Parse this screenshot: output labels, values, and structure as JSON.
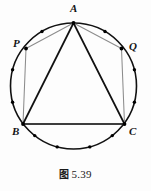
{
  "figure": {
    "caption_cjk": "图",
    "caption_number": "5.39",
    "caption_full": "图 5.39",
    "colors": {
      "stroke_dark": "#111111",
      "stroke_light": "#8c8c8c",
      "background": "#fdfdfd",
      "dot_fill": "#000000",
      "label_color": "#141414"
    },
    "circle": {
      "cx": 73.5,
      "cy": 86.0,
      "r": 63.0,
      "stroke_width": 1.6
    },
    "labels": [
      {
        "id": "A",
        "text": "A",
        "x": 70.0,
        "y": 3.0
      },
      {
        "id": "P",
        "text": "P",
        "x": 13.0,
        "y": 38.0
      },
      {
        "id": "Q",
        "text": "Q",
        "x": 129.0,
        "y": 41.0
      },
      {
        "id": "B",
        "text": "B",
        "x": 12.0,
        "y": 126.0
      },
      {
        "id": "C",
        "text": "C",
        "x": 129.0,
        "y": 126.0
      }
    ],
    "vertices": [
      {
        "id": "A",
        "x": 73.5,
        "y": 23.0,
        "angle_deg": 90
      },
      {
        "id": "P",
        "x": 26.0,
        "y": 48.5,
        "angle_deg": 147
      },
      {
        "id": "Q",
        "x": 121.5,
        "y": 48.5,
        "angle_deg": 33
      },
      {
        "id": "B",
        "x": 23.0,
        "y": 124.0,
        "angle_deg": 210
      },
      {
        "id": "C",
        "x": 124.5,
        "y": 124.0,
        "angle_deg": 330
      }
    ],
    "triangle": {
      "name": "inscribed-triangle-ABC",
      "points": "A,B,C",
      "stroke_width": 1.7
    },
    "light_chords": [
      {
        "id": "AP",
        "from": "A",
        "to": "P"
      },
      {
        "id": "AQ",
        "from": "A",
        "to": "Q"
      },
      {
        "id": "PB",
        "from": "P",
        "to": "B"
      },
      {
        "id": "QC",
        "from": "Q",
        "to": "C"
      },
      {
        "id": "BC-light",
        "from": "B",
        "to": "C"
      }
    ],
    "arc_dots": [
      {
        "id": "dot-1",
        "angle_deg": 120,
        "x": 42.0,
        "y": 31.5
      },
      {
        "id": "dot-2",
        "angle_deg": 60,
        "x": 105.0,
        "y": 31.5
      },
      {
        "id": "dot-3",
        "angle_deg": 165,
        "x": 12.6,
        "y": 69.7
      },
      {
        "id": "dot-4",
        "angle_deg": 195,
        "x": 12.6,
        "y": 102.3
      },
      {
        "id": "dot-5",
        "angle_deg": 15,
        "x": 134.4,
        "y": 69.7
      },
      {
        "id": "dot-6",
        "angle_deg": 345,
        "x": 134.4,
        "y": 102.3
      },
      {
        "id": "dot-7",
        "angle_deg": 232,
        "x": 34.7,
        "y": 135.6
      },
      {
        "id": "dot-8",
        "angle_deg": 255,
        "x": 57.2,
        "y": 146.9
      },
      {
        "id": "dot-9",
        "angle_deg": 285,
        "x": 89.8,
        "y": 146.9
      },
      {
        "id": "dot-10",
        "angle_deg": 308,
        "x": 112.3,
        "y": 135.6
      }
    ],
    "vertex_dot_radius": 1.9,
    "arc_dot_radius": 1.7
  }
}
